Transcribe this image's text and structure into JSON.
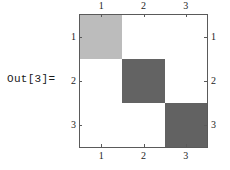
{
  "prompt": {
    "label": "Out[3]="
  },
  "plot": {
    "name": "matrix-plot",
    "frame_color": "#5a5a5a",
    "background": "#ffffff",
    "axes": {
      "top": {
        "ticks": [
          "1",
          "2",
          "3"
        ]
      },
      "bottom": {
        "ticks": [
          "1",
          "2",
          "3"
        ]
      },
      "left": {
        "ticks": [
          "1",
          "2",
          "3"
        ]
      },
      "right": {
        "ticks": [
          "1",
          "2",
          "3"
        ]
      }
    }
  },
  "chart_data": {
    "type": "heatmap",
    "title": "",
    "xlabel": "",
    "ylabel": "",
    "x_tick_labels": [
      "1",
      "2",
      "3"
    ],
    "y_tick_labels": [
      "1",
      "2",
      "3"
    ],
    "xlim": [
      0.5,
      3.5
    ],
    "ylim": [
      0.5,
      3.5
    ],
    "grid": false,
    "legend": "none",
    "rows": 3,
    "cols": 3,
    "row_order": "top-to-bottom",
    "values": [
      [
        0.45,
        0,
        0
      ],
      [
        0,
        0.78,
        0
      ],
      [
        0,
        0,
        0.78
      ]
    ],
    "cell_colors": [
      [
        "#bcbcbc",
        "#ffffff",
        "#ffffff"
      ],
      [
        "#ffffff",
        "#636363",
        "#ffffff"
      ],
      [
        "#ffffff",
        "#ffffff",
        "#626262"
      ]
    ],
    "annotations": []
  }
}
